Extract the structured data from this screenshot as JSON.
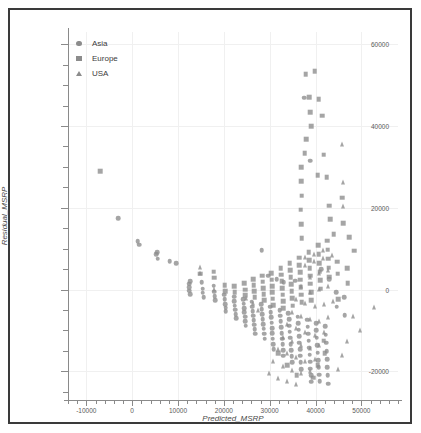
{
  "chart_data": {
    "type": "scatter",
    "title": "",
    "xlabel": "Predicted_MSRP",
    "ylabel": "Residual_MSRP",
    "xlim": [
      -14000,
      58000
    ],
    "ylim": [
      -27000,
      63000
    ],
    "xticks": [
      -10000,
      0,
      10000,
      20000,
      30000,
      40000,
      50000
    ],
    "yticks": [
      -20000,
      0,
      20000,
      40000,
      60000
    ],
    "xtick_labels": [
      "-10000",
      "0",
      "10000",
      "20000",
      "30000",
      "40000",
      "50000"
    ],
    "ytick_labels": [
      "-20000",
      "0",
      "20000",
      "40000",
      "60000"
    ],
    "grid": true,
    "legend_position": "top-left",
    "marker_color": "#8c8c8c",
    "series": [
      {
        "name": "Asia",
        "marker": "circle",
        "points": [
          [
            -3000,
            17400
          ],
          [
            1200,
            11800
          ],
          [
            1500,
            11000
          ],
          [
            5200,
            8600
          ],
          [
            5400,
            9200
          ],
          [
            5600,
            7600
          ],
          [
            8200,
            7000
          ],
          [
            9600,
            6400
          ],
          [
            12400,
            1400
          ],
          [
            12400,
            600
          ],
          [
            12400,
            -300
          ],
          [
            12600,
            2100
          ],
          [
            12700,
            -1100
          ],
          [
            15200,
            1800
          ],
          [
            15400,
            200
          ],
          [
            15400,
            -800
          ],
          [
            15600,
            -1900
          ],
          [
            17800,
            1000
          ],
          [
            17900,
            -500
          ],
          [
            18000,
            -1600
          ],
          [
            18100,
            -2600
          ],
          [
            20100,
            -1200
          ],
          [
            20200,
            -2400
          ],
          [
            20300,
            -3500
          ],
          [
            20400,
            -4400
          ],
          [
            20400,
            -5300
          ],
          [
            22200,
            -1700
          ],
          [
            22300,
            -2900
          ],
          [
            22400,
            -3900
          ],
          [
            22500,
            -4900
          ],
          [
            22600,
            -6000
          ],
          [
            22700,
            -7000
          ],
          [
            24200,
            -2300
          ],
          [
            24300,
            -3400
          ],
          [
            24400,
            -4500
          ],
          [
            24500,
            -5600
          ],
          [
            24600,
            -6600
          ],
          [
            24700,
            -7700
          ],
          [
            24800,
            -8800
          ],
          [
            26100,
            -3000
          ],
          [
            26200,
            -4200
          ],
          [
            26300,
            -5300
          ],
          [
            26400,
            -6400
          ],
          [
            26500,
            -7500
          ],
          [
            26600,
            -8600
          ],
          [
            26700,
            -9700
          ],
          [
            26800,
            -10800
          ],
          [
            28200,
            -3600
          ],
          [
            28300,
            -4800
          ],
          [
            28400,
            -6000
          ],
          [
            28500,
            -7200
          ],
          [
            28600,
            -8400
          ],
          [
            28700,
            -9600
          ],
          [
            28800,
            -10800
          ],
          [
            28900,
            -12000
          ],
          [
            30100,
            -4200
          ],
          [
            30200,
            -5500
          ],
          [
            30300,
            -6800
          ],
          [
            30400,
            -8100
          ],
          [
            30500,
            -9400
          ],
          [
            30600,
            -10700
          ],
          [
            30700,
            -12000
          ],
          [
            30800,
            -13300
          ],
          [
            30900,
            -14600
          ],
          [
            32200,
            -5000
          ],
          [
            32300,
            -6400
          ],
          [
            32400,
            -7800
          ],
          [
            32500,
            -9200
          ],
          [
            32600,
            -10600
          ],
          [
            32700,
            -12000
          ],
          [
            32800,
            -13400
          ],
          [
            32900,
            -14800
          ],
          [
            33000,
            -16200
          ],
          [
            34100,
            -5800
          ],
          [
            34200,
            -7300
          ],
          [
            34300,
            -8800
          ],
          [
            34400,
            -10300
          ],
          [
            34500,
            -11800
          ],
          [
            34600,
            -13300
          ],
          [
            34700,
            -14800
          ],
          [
            34800,
            -16300
          ],
          [
            34900,
            -17800
          ],
          [
            36100,
            -6600
          ],
          [
            36200,
            -8200
          ],
          [
            36300,
            -9800
          ],
          [
            36400,
            -11400
          ],
          [
            36500,
            -13000
          ],
          [
            36600,
            -14600
          ],
          [
            36700,
            -16200
          ],
          [
            36800,
            -17800
          ],
          [
            36900,
            -19400
          ],
          [
            38200,
            -7400
          ],
          [
            38300,
            -9100
          ],
          [
            38400,
            -10800
          ],
          [
            38500,
            -12500
          ],
          [
            38600,
            -14200
          ],
          [
            38700,
            -15900
          ],
          [
            38800,
            -17600
          ],
          [
            38900,
            -19300
          ],
          [
            39000,
            -21000
          ],
          [
            39100,
            -22500
          ],
          [
            40100,
            -8200
          ],
          [
            40200,
            -10000
          ],
          [
            40300,
            -11800
          ],
          [
            40400,
            -13600
          ],
          [
            40500,
            -15400
          ],
          [
            40600,
            -17200
          ],
          [
            40700,
            -19000
          ],
          [
            40800,
            -20800
          ],
          [
            40900,
            -22400
          ],
          [
            42100,
            -9000
          ],
          [
            42200,
            -11000
          ],
          [
            42300,
            -13000
          ],
          [
            42400,
            -15000
          ],
          [
            42500,
            -17000
          ],
          [
            42600,
            -19000
          ],
          [
            42700,
            -21000
          ],
          [
            42800,
            -23000
          ],
          [
            38800,
            31500
          ],
          [
            28300,
            9600
          ],
          [
            37500,
            46900
          ],
          [
            44500,
            -700
          ],
          [
            44600,
            -4200
          ],
          [
            46300,
            -1800
          ],
          [
            46400,
            -6200
          ],
          [
            41200,
            5000
          ],
          [
            43000,
            2600
          ],
          [
            35600,
            2200
          ],
          [
            33100,
            1800
          ],
          [
            31500,
            2600
          ],
          [
            29700,
            3400
          ]
        ]
      },
      {
        "name": "Europe",
        "marker": "square",
        "points": [
          [
            -7000,
            29000
          ],
          [
            37900,
            52700
          ],
          [
            39800,
            53400
          ],
          [
            40700,
            46600
          ],
          [
            41500,
            42500
          ],
          [
            38600,
            47000
          ],
          [
            38900,
            43400
          ],
          [
            39100,
            39900
          ],
          [
            38000,
            36800
          ],
          [
            37600,
            33400
          ],
          [
            41800,
            33000
          ],
          [
            36900,
            30000
          ],
          [
            36900,
            26500
          ],
          [
            37000,
            23000
          ],
          [
            36800,
            19500
          ],
          [
            36900,
            16000
          ],
          [
            37000,
            12600
          ],
          [
            40500,
            28000
          ],
          [
            42400,
            27500
          ],
          [
            45800,
            22500
          ],
          [
            46000,
            16200
          ],
          [
            47300,
            12800
          ],
          [
            48400,
            9500
          ],
          [
            46900,
            5200
          ],
          [
            47000,
            1500
          ],
          [
            43000,
            20500
          ],
          [
            43200,
            17200
          ],
          [
            44000,
            13500
          ],
          [
            14800,
            3900
          ],
          [
            17800,
            4400
          ],
          [
            17900,
            2900
          ],
          [
            20200,
            1100
          ],
          [
            20300,
            -400
          ],
          [
            22300,
            900
          ],
          [
            22400,
            -600
          ],
          [
            24500,
            1500
          ],
          [
            24600,
            0
          ],
          [
            24700,
            -1400
          ],
          [
            26400,
            2600
          ],
          [
            26500,
            1100
          ],
          [
            26600,
            -400
          ],
          [
            26700,
            -1900
          ],
          [
            28400,
            3400
          ],
          [
            28500,
            1900
          ],
          [
            28600,
            400
          ],
          [
            28700,
            -1100
          ],
          [
            28800,
            -2600
          ],
          [
            30300,
            4000
          ],
          [
            30400,
            2400
          ],
          [
            30500,
            900
          ],
          [
            30600,
            -700
          ],
          [
            30700,
            -2200
          ],
          [
            30800,
            -3800
          ],
          [
            32400,
            5200
          ],
          [
            32500,
            3600
          ],
          [
            32600,
            2000
          ],
          [
            32700,
            400
          ],
          [
            32800,
            -1200
          ],
          [
            32900,
            -2900
          ],
          [
            33000,
            -4500
          ],
          [
            34400,
            6400
          ],
          [
            34500,
            4700
          ],
          [
            34600,
            3000
          ],
          [
            34700,
            1300
          ],
          [
            34800,
            -400
          ],
          [
            34900,
            -2100
          ],
          [
            35000,
            -3900
          ],
          [
            36400,
            7800
          ],
          [
            36500,
            6000
          ],
          [
            36600,
            4200
          ],
          [
            36700,
            2400
          ],
          [
            36800,
            600
          ],
          [
            36900,
            -1200
          ],
          [
            37000,
            -3100
          ],
          [
            38500,
            9200
          ],
          [
            38600,
            7200
          ],
          [
            38700,
            5300
          ],
          [
            38800,
            3400
          ],
          [
            38900,
            1400
          ],
          [
            39000,
            -600
          ],
          [
            39100,
            -2600
          ],
          [
            40600,
            10800
          ],
          [
            40700,
            8600
          ],
          [
            40800,
            6500
          ],
          [
            40900,
            4400
          ],
          [
            41000,
            2300
          ],
          [
            41100,
            200
          ],
          [
            42600,
            12000
          ],
          [
            42700,
            9800
          ],
          [
            42800,
            7600
          ],
          [
            42900,
            5400
          ],
          [
            43000,
            3200
          ],
          [
            44700,
            6800
          ],
          [
            44800,
            3900
          ],
          [
            45000,
            -2400
          ],
          [
            41800,
            -12500
          ],
          [
            42000,
            -15500
          ],
          [
            40500,
            -18500
          ],
          [
            39500,
            -21500
          ],
          [
            35900,
            -21000
          ],
          [
            33800,
            -18500
          ],
          [
            31800,
            -15500
          ]
        ]
      },
      {
        "name": "USA",
        "marker": "triangle",
        "points": [
          [
            45800,
            35600
          ],
          [
            46000,
            26200
          ],
          [
            46100,
            20500
          ],
          [
            14800,
            5600
          ],
          [
            14900,
            4100
          ],
          [
            17800,
            200
          ],
          [
            37600,
            7900
          ],
          [
            37700,
            6100
          ],
          [
            39600,
            8800
          ],
          [
            39700,
            7000
          ],
          [
            41600,
            9600
          ],
          [
            41700,
            7800
          ],
          [
            43600,
            8400
          ],
          [
            38800,
            3200
          ],
          [
            40800,
            4000
          ],
          [
            42800,
            4800
          ],
          [
            36800,
            800
          ],
          [
            38800,
            -600
          ],
          [
            40800,
            100
          ],
          [
            42800,
            1000
          ],
          [
            35800,
            -2200
          ],
          [
            37800,
            -3200
          ],
          [
            39800,
            -4000
          ],
          [
            41800,
            -3400
          ],
          [
            43800,
            -2800
          ],
          [
            34800,
            -5500
          ],
          [
            36800,
            -6500
          ],
          [
            38800,
            -7200
          ],
          [
            40800,
            -7800
          ],
          [
            42800,
            -6800
          ],
          [
            33800,
            -8500
          ],
          [
            35800,
            -9500
          ],
          [
            37800,
            -10400
          ],
          [
            39800,
            -11200
          ],
          [
            41800,
            -10400
          ],
          [
            32800,
            -11500
          ],
          [
            34800,
            -12600
          ],
          [
            36800,
            -13500
          ],
          [
            38800,
            -14400
          ],
          [
            40800,
            -13600
          ],
          [
            31800,
            -14500
          ],
          [
            33800,
            -15600
          ],
          [
            35800,
            -16600
          ],
          [
            37800,
            -17500
          ],
          [
            39800,
            -17000
          ],
          [
            30800,
            -17500
          ],
          [
            32800,
            -18600
          ],
          [
            34800,
            -19600
          ],
          [
            36800,
            -20400
          ],
          [
            38800,
            -20000
          ],
          [
            29800,
            -20500
          ],
          [
            31800,
            -21600
          ],
          [
            33800,
            -22400
          ],
          [
            35800,
            -23000
          ],
          [
            48200,
            -6500
          ],
          [
            49800,
            -9800
          ],
          [
            52800,
            -4200
          ],
          [
            46800,
            -12500
          ],
          [
            45800,
            -16000
          ],
          [
            44800,
            -19500
          ],
          [
            27500,
            -5000
          ],
          [
            26400,
            -3200
          ],
          [
            24800,
            -2000
          ]
        ]
      }
    ]
  },
  "legend": {
    "items": [
      {
        "label": "Asia",
        "marker": "circle"
      },
      {
        "label": "Europe",
        "marker": "square"
      },
      {
        "label": "USA",
        "marker": "triangle"
      }
    ]
  }
}
